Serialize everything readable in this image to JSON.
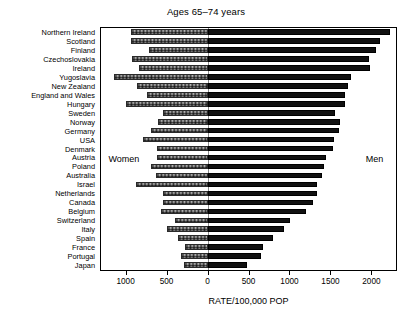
{
  "chart_data": {
    "type": "bar",
    "orientation": "horizontal",
    "subtype": "diverging-population-pyramid",
    "title": "Ages 65–74 years",
    "xlabel": "RATE/100,000 POP",
    "ylabel": "",
    "grid": false,
    "legend": "none",
    "annotations": [
      {
        "text": "Women",
        "side": "left"
      },
      {
        "text": "Men",
        "side": "right"
      }
    ],
    "axis": {
      "tick_values": [
        -1000,
        -500,
        0,
        500,
        1000,
        1500,
        2000
      ],
      "tick_labels": [
        "1000",
        "500",
        "0",
        "500",
        "1000",
        "1500",
        "2000"
      ],
      "xlim": [
        -1300,
        2300
      ],
      "zero_at_value": 0
    },
    "categories": [
      "Northern Ireland",
      "Scotland",
      "Finland",
      "Czechoslovakia",
      "Ireland",
      "Yugoslavia",
      "New Zealand",
      "England and Wales",
      "Hungary",
      "Sweden",
      "Norway",
      "Germany",
      "USA",
      "Denmark",
      "Austria",
      "Poland",
      "Australia",
      "Israel",
      "Netherlands",
      "Canada",
      "Belgium",
      "Switzerland",
      "Italy",
      "Spain",
      "France",
      "Portugal",
      "Japan"
    ],
    "series": [
      {
        "name": "Men",
        "direction": "right",
        "color": "#111111",
        "values": [
          2230,
          2100,
          2060,
          1965,
          1985,
          1745,
          1710,
          1680,
          1675,
          1555,
          1620,
          1610,
          1545,
          1530,
          1450,
          1425,
          1400,
          1340,
          1335,
          1290,
          1200,
          1010,
          935,
          800,
          675,
          655,
          480
        ]
      },
      {
        "name": "Women",
        "direction": "left",
        "color": "#d8d8d8",
        "values": [
          930,
          940,
          720,
          920,
          840,
          1140,
          860,
          740,
          995,
          545,
          600,
          695,
          790,
          615,
          615,
          690,
          625,
          875,
          545,
          545,
          570,
          400,
          490,
          355,
          275,
          325,
          290
        ]
      }
    ]
  },
  "colors": {
    "men_fill": "#111111",
    "women_fill": "#d8d8d8",
    "frame": "#000000",
    "zero_line": "#888888",
    "background": "#ffffff"
  }
}
